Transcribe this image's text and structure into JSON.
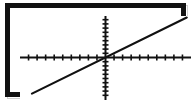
{
  "window": {
    "title": "Graphing calculator screen"
  },
  "chart_data": {
    "type": "line",
    "title": "",
    "subtitle": "",
    "xlabel": "",
    "ylabel": "",
    "grid": false,
    "legend": false,
    "legend_position": "none",
    "xlim": [
      -10,
      10
    ],
    "ylim": [
      -10,
      10
    ],
    "x_axis": {
      "position_y": 0,
      "tick_spacing": 1,
      "tick_count_left": 10,
      "tick_count_right": 10,
      "tick_labels": []
    },
    "y_axis": {
      "position_x": 0,
      "tick_spacing": 1,
      "tick_count_up": 10,
      "tick_count_down": 10,
      "tick_labels": []
    },
    "series": [
      {
        "name": "y = x",
        "type": "line",
        "slope": 1,
        "intercept": 0,
        "color": "#111111",
        "x": [
          -8.6,
          9.5
        ],
        "values": [
          -8.6,
          9.5
        ],
        "points": [
          {
            "x": -8.6,
            "y": -8.6
          },
          {
            "x": 0,
            "y": 0
          },
          {
            "x": 9.5,
            "y": 9.5
          }
        ]
      }
    ],
    "annotations": [],
    "colors": {
      "frame": "#111111",
      "axis": "#111111",
      "plot_line": "#111111",
      "background": "#ffffff"
    }
  },
  "icons": {
    "axis": "coordinate-axes-icon",
    "line": "linear-function-icon"
  }
}
